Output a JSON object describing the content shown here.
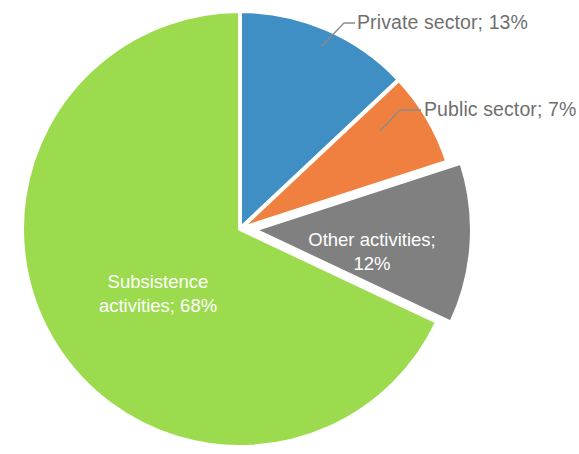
{
  "chart_data": {
    "type": "pie",
    "title": "",
    "subtitle": "",
    "xlabel": "",
    "ylabel": "",
    "grid": false,
    "legend_position": "none",
    "label_format": "{name}; {value}%",
    "start_angle_deg": 0,
    "direction": "clockwise",
    "categories": [
      "Private sector",
      "Public sector",
      "Other activities",
      "Subsistence activities"
    ],
    "values": [
      13,
      7,
      12,
      68
    ],
    "units": "percent",
    "total": 100,
    "slices": [
      {
        "name": "Private sector",
        "value": 13,
        "label": "Private sector; 13%",
        "color": "#3f8fc4",
        "label_placement": "outside",
        "label_color": "#6f6f6f",
        "exploded": false,
        "leader_line": true
      },
      {
        "name": "Public sector",
        "value": 7,
        "label": "Public sector; 7%",
        "color": "#f0803f",
        "label_placement": "outside",
        "label_color": "#6f6f6f",
        "exploded": false,
        "leader_line": true
      },
      {
        "name": "Other activities",
        "value": 12,
        "label_line_1": "Other activities;",
        "label_line_2": "12%",
        "label": "Other activities; 12%",
        "color": "#808080",
        "label_placement": "inside",
        "label_color": "#ffffff",
        "exploded": true,
        "leader_line": false
      },
      {
        "name": "Subsistence activities",
        "value": 68,
        "label_line_1": "Subsistence",
        "label_line_2": "activities; 68%",
        "label": "Subsistence activities; 68%",
        "color": "#9bdb4d",
        "label_placement": "inside",
        "label_color": "#ffffff",
        "exploded": false,
        "leader_line": false
      }
    ],
    "geometry": {
      "center_x": 240,
      "center_y": 229,
      "radius": 218,
      "explode_offset": 14,
      "separator_color": "#ffffff",
      "separator_width": 4
    },
    "background_color": "#ffffff"
  }
}
